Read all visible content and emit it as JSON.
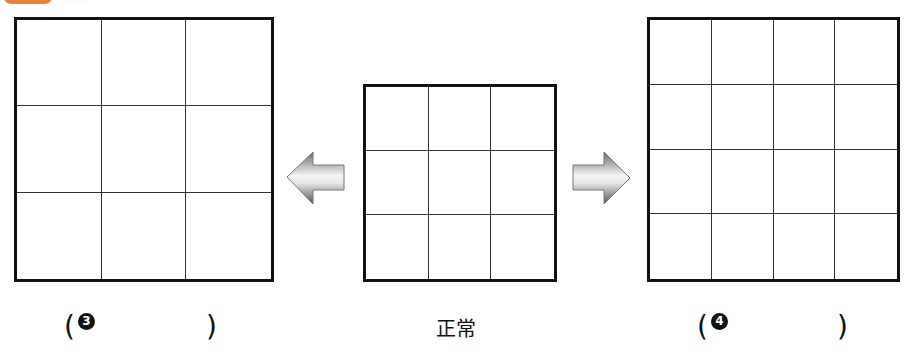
{
  "header": {
    "badge_color": "#e8803e",
    "title_text": "……"
  },
  "figures": {
    "left": {
      "rows": 3,
      "cols": 3,
      "caption_marker": "3",
      "caption_open": "(",
      "caption_close": ")"
    },
    "center": {
      "rows": 3,
      "cols": 3,
      "caption": "正常"
    },
    "right": {
      "rows": 4,
      "cols": 4,
      "caption_marker": "4",
      "caption_open": "(",
      "caption_close": ")"
    }
  },
  "arrows": {
    "left": {
      "direction": "left",
      "icon": "arrow-left-icon"
    },
    "right": {
      "direction": "right",
      "icon": "arrow-right-icon"
    }
  }
}
